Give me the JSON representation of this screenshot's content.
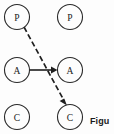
{
  "figure": {
    "background_color": "#fdfdfd",
    "stroke_color": "#1f1f1f",
    "caption": {
      "text": "Figu",
      "x": 90,
      "y": 116,
      "bold": true,
      "truncated": true
    },
    "nodes": [
      {
        "id": "p-left",
        "label": "P",
        "cx": 17,
        "cy": 17,
        "r": 12.5,
        "column": "left",
        "row": "top"
      },
      {
        "id": "p-right",
        "label": "P",
        "cx": 70,
        "cy": 17,
        "r": 12.5,
        "column": "right",
        "row": "top"
      },
      {
        "id": "a-left",
        "label": "A",
        "cx": 17,
        "cy": 70,
        "r": 12.5,
        "column": "left",
        "row": "middle"
      },
      {
        "id": "a-right",
        "label": "A",
        "cx": 70,
        "cy": 70,
        "r": 12.5,
        "column": "right",
        "row": "middle"
      },
      {
        "id": "c-left",
        "label": "C",
        "cx": 17,
        "cy": 117,
        "r": 12.5,
        "column": "left",
        "row": "bottom"
      },
      {
        "id": "c-right",
        "label": "C",
        "cx": 70,
        "cy": 117,
        "r": 12.5,
        "column": "right",
        "row": "bottom"
      }
    ],
    "edges": [
      {
        "id": "edge-a-to-a",
        "from": "a-left",
        "to": "a-right",
        "style": "solid",
        "arrow": true,
        "x1": 30,
        "y1": 70,
        "x2": 57,
        "y2": 70
      },
      {
        "id": "edge-p-to-c",
        "from": "p-left",
        "to": "c-right",
        "style": "dashed",
        "arrow": true,
        "x1": 24,
        "y1": 27,
        "x2": 66,
        "y2": 104
      }
    ]
  }
}
